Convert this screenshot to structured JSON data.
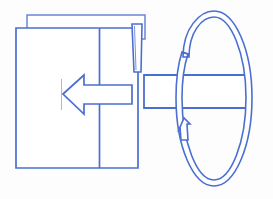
{
  "canvas": {
    "width": 273,
    "height": 199,
    "background_color": "#fdfdfd"
  },
  "style": {
    "line_color": "#4a6fd0",
    "line_color_light": "#8da3e0",
    "fill_color": "#ffffff",
    "stroke_width": 1.6,
    "thin_stroke_width": 0.9
  },
  "diagram": {
    "type": "technical-line-art",
    "parts": [
      {
        "id": "back-panel",
        "name": "back-panel",
        "shape": "rectangle",
        "x": 27,
        "y": 15,
        "width": 118,
        "height": 24
      },
      {
        "id": "main-box",
        "name": "main-box",
        "shape": "rectangle",
        "x": 16,
        "y": 28,
        "width": 122,
        "height": 140
      },
      {
        "id": "panel-divider",
        "name": "panel-divider-line",
        "shape": "vertical-line",
        "x": 99,
        "y1": 28,
        "y2": 168
      },
      {
        "id": "hinged-flap",
        "name": "hinged-flap",
        "shape": "tapered-quad",
        "x": 132,
        "y": 24,
        "width": 10,
        "height": 48
      },
      {
        "id": "insertion-arrow",
        "name": "insertion-arrow",
        "shape": "left-arrow",
        "direction": "left",
        "tip_x": 62,
        "tail_x": 132,
        "center_y": 94,
        "shaft_height": 18,
        "head_width": 22,
        "head_height": 42
      },
      {
        "id": "alignment-tick",
        "name": "alignment-tick-mark",
        "shape": "vertical-line",
        "x": 61,
        "y1": 79,
        "y2": 110
      },
      {
        "id": "bar-element",
        "name": "horizontal-bar-element",
        "shape": "rectangle",
        "x": 144,
        "y": 75,
        "width": 105,
        "height": 33
      },
      {
        "id": "rotation-arrow",
        "name": "rotation-arrow-ellipse",
        "shape": "ellipse-arrow",
        "center_x": 213,
        "center_y": 98,
        "radius_x": 38,
        "radius_y": 88,
        "arrowhead": "bottom-left-pointing-up",
        "direction": "counter-clockwise"
      }
    ]
  },
  "labels": {
    "caption": ""
  }
}
